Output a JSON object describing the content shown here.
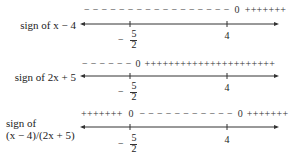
{
  "rows": [
    {
      "label": "sign of x − 4",
      "signs_left": "− − − − − − − − − − − − − − − − −",
      "zero_at_4": "0",
      "signs_right": "+++++++"
    },
    {
      "label": "sign of 2x + 5",
      "signs_left": "− − − − − −",
      "zero_at_neg": "0",
      "signs_right": "++++++++++++++++++++++"
    },
    {
      "label_line1": "sign of",
      "label_line2": "(x − 4)/(2x + 5)",
      "signs_left": "+++++++",
      "zero_at_neg": "0",
      "signs_mid": "− − − − − − − − − − −",
      "zero_at_4": "0",
      "signs_right": "+++++++"
    }
  ],
  "ticks": {
    "neg_minus": "−",
    "neg_num": "5",
    "neg_den": "2",
    "pos": "4"
  }
}
